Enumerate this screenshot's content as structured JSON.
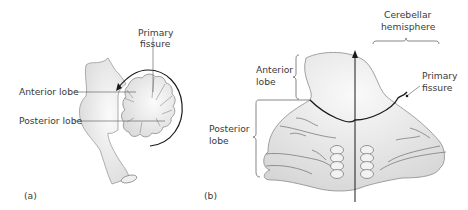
{
  "figure": {
    "panel_a": {
      "label": "(a)",
      "labels": {
        "primary_fissure_line1": "Primary",
        "primary_fissure_line2": "fissure",
        "anterior_lobe": "Anterior lobe",
        "posterior_lobe": "Posterior lobe"
      }
    },
    "panel_b": {
      "label": "(b)",
      "labels": {
        "cerebellar_hemisphere_line1": "Cerebellar",
        "cerebellar_hemisphere_line2": "hemisphere",
        "anterior_lobe_line1": "Anterior",
        "anterior_lobe_line2": "lobe",
        "posterior_lobe_line1": "Posterior",
        "posterior_lobe_line2": "lobe",
        "primary_fissure_line1": "Primary",
        "primary_fissure_line2": "fissure"
      }
    },
    "colors": {
      "fill": "#e4e4e4",
      "fill_light": "#f6f6f6",
      "stroke": "#8a8a8a",
      "dark": "#1a1a1a",
      "text": "#3a3a3a"
    }
  }
}
